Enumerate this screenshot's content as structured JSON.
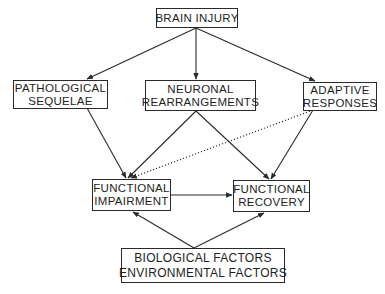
{
  "diagram": {
    "type": "flow",
    "nodes": {
      "brain_injury": {
        "lines": [
          "BRAIN INJURY"
        ]
      },
      "pathological": {
        "lines": [
          "PATHOLOGICAL",
          "SEQUELAE"
        ]
      },
      "neuronal": {
        "lines": [
          "NEURONAL",
          "REARRANGEMENTS"
        ]
      },
      "adaptive": {
        "lines": [
          "ADAPTIVE",
          "RESPONSES"
        ]
      },
      "impairment": {
        "lines": [
          "FUNCTIONAL",
          "IMPAIRMENT"
        ]
      },
      "recovery": {
        "lines": [
          "FUNCTIONAL",
          "RECOVERY"
        ]
      },
      "factors": {
        "lines": [
          "BIOLOGICAL FACTORS",
          "ENVIRONMENTAL FACTORS"
        ]
      }
    },
    "edges": [
      {
        "from": "BRAIN INJURY",
        "to": "PATHOLOGICAL SEQUELAE",
        "style": "solid"
      },
      {
        "from": "BRAIN INJURY",
        "to": "NEURONAL REARRANGEMENTS",
        "style": "solid"
      },
      {
        "from": "BRAIN INJURY",
        "to": "ADAPTIVE RESPONSES",
        "style": "solid"
      },
      {
        "from": "PATHOLOGICAL SEQUELAE",
        "to": "FUNCTIONAL IMPAIRMENT",
        "style": "solid"
      },
      {
        "from": "NEURONAL REARRANGEMENTS",
        "to": "FUNCTIONAL IMPAIRMENT",
        "style": "solid"
      },
      {
        "from": "NEURONAL REARRANGEMENTS",
        "to": "FUNCTIONAL RECOVERY",
        "style": "solid"
      },
      {
        "from": "ADAPTIVE RESPONSES",
        "to": "FUNCTIONAL RECOVERY",
        "style": "solid"
      },
      {
        "from": "ADAPTIVE RESPONSES",
        "to": "FUNCTIONAL IMPAIRMENT",
        "style": "dotted"
      },
      {
        "from": "FUNCTIONAL IMPAIRMENT",
        "to": "FUNCTIONAL RECOVERY",
        "style": "solid"
      },
      {
        "from": "BIOLOGICAL FACTORS / ENVIRONMENTAL FACTORS",
        "to": "FUNCTIONAL IMPAIRMENT",
        "style": "solid"
      },
      {
        "from": "BIOLOGICAL FACTORS / ENVIRONMENTAL FACTORS",
        "to": "FUNCTIONAL RECOVERY",
        "style": "solid"
      }
    ],
    "colors": {
      "line": "#2a2a2a",
      "text": "#1e1e1e",
      "background": "#ffffff"
    }
  }
}
